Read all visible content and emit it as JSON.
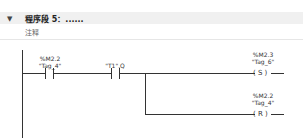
{
  "network": {
    "expand_icon": "triangle-down-icon",
    "title": "程序段 5：......",
    "comment": "注释"
  },
  "ladder": {
    "contact1": {
      "address": "%M2.2",
      "tag": "\"Tag_4\"",
      "type": "normally-open"
    },
    "contact2": {
      "address": "",
      "tag": "\"T1\".Q",
      "type": "normally-open"
    },
    "coil1": {
      "address": "%M2.3",
      "tag": "\"Tag_6\"",
      "symbol": "( S )"
    },
    "coil2": {
      "address": "%M2.2",
      "tag": "\"Tag_4\"",
      "symbol": "( R )"
    }
  }
}
